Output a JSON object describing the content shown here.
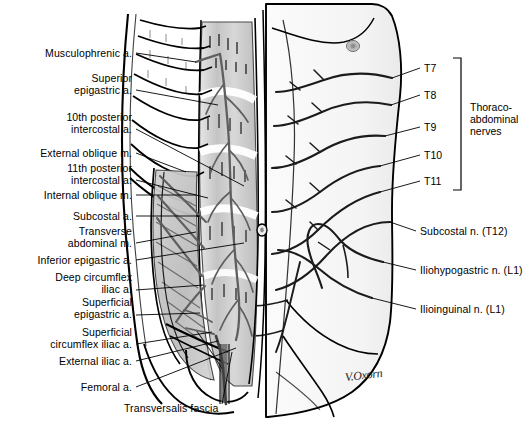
{
  "figure": {
    "signature": "V.Oxorn",
    "background_color": "#ffffff",
    "ink_color": "#000000",
    "muscle_shade_color": "#c9c9c9",
    "vessel_color": "#5a5a5a"
  },
  "labels_left": [
    {
      "id": "musculophrenic-a",
      "text": "Musculophrenic a.",
      "x": 132,
      "y": 48,
      "leader": [
        136,
        53,
        196,
        62
      ]
    },
    {
      "id": "superior-epigastric-a",
      "text": "Superior\nepigastric a.",
      "x": 132,
      "y": 73,
      "leader": [
        136,
        90,
        218,
        105
      ]
    },
    {
      "id": "10th-posterior-intercostal-a",
      "text": "10th posterior\nintercostal a.",
      "x": 132,
      "y": 112,
      "leader": [
        136,
        129,
        244,
        186
      ]
    },
    {
      "id": "external-oblique-m",
      "text": "External oblique m.",
      "x": 132,
      "y": 148,
      "leader": [
        136,
        153,
        186,
        172
      ]
    },
    {
      "id": "11th-posterior-intercostal-a",
      "text": "11th posterior\nintercostal a.",
      "x": 132,
      "y": 163,
      "leader": [
        136,
        180,
        208,
        198
      ]
    },
    {
      "id": "internal-oblique-m",
      "text": "Internal oblique m.",
      "x": 132,
      "y": 190,
      "leader": [
        136,
        195,
        196,
        195
      ]
    },
    {
      "id": "subcostal-a",
      "text": "Subcostal a.",
      "x": 132,
      "y": 211,
      "leader": [
        136,
        216,
        200,
        216
      ]
    },
    {
      "id": "transverse-abdominal-m",
      "text": "Transverse\nabdominal m.",
      "x": 132,
      "y": 226,
      "leader": [
        136,
        243,
        196,
        232
      ]
    },
    {
      "id": "inferior-epigastric-a",
      "text": "Inferior epigastric a.",
      "x": 132,
      "y": 255,
      "leader": [
        136,
        260,
        244,
        243
      ]
    },
    {
      "id": "deep-circumflex-iliac-a",
      "text": "Deep circumflex\niliac a.",
      "x": 132,
      "y": 272,
      "leader": [
        136,
        290,
        204,
        285
      ]
    },
    {
      "id": "superficial-epigastric-a",
      "text": "Superficial\nepigastric a.",
      "x": 132,
      "y": 297,
      "leader": [
        136,
        315,
        200,
        313
      ]
    },
    {
      "id": "superficial-circumflex-iliac-a",
      "text": "Superficial\ncircumflex iliac a.",
      "x": 132,
      "y": 327,
      "leader": [
        136,
        344,
        212,
        332
      ]
    },
    {
      "id": "external-iliac-a",
      "text": "External iliac a.",
      "x": 132,
      "y": 356,
      "leader": [
        136,
        361,
        218,
        341
      ]
    },
    {
      "id": "femoral-a",
      "text": "Femoral a.",
      "x": 132,
      "y": 382,
      "leader": [
        136,
        387,
        236,
        348
      ]
    }
  ],
  "labels_bottom": [
    {
      "id": "transversalis-fascia",
      "text": "Transversalis fascia",
      "x": 124,
      "y": 403,
      "leader": [
        222,
        404,
        232,
        352
      ]
    }
  ],
  "labels_right": [
    {
      "id": "subcostal-n-t12",
      "text": "Subcostal n. (T12)",
      "x": 420,
      "y": 226,
      "leader": [
        416,
        231,
        390,
        222
      ]
    },
    {
      "id": "iliohypogastric-n-l1",
      "text": "Iliohypogastric n. (L1)",
      "x": 420,
      "y": 265,
      "leader": [
        416,
        270,
        383,
        262
      ]
    },
    {
      "id": "ilioinguinal-n-l1",
      "text": "Ilioinguinal n. (L1)",
      "x": 420,
      "y": 304,
      "leader": [
        416,
        309,
        372,
        298
      ]
    }
  ],
  "nerve_levels": [
    {
      "id": "t7",
      "text": "T7",
      "x": 424,
      "y": 63,
      "leader": [
        420,
        68,
        392,
        78
      ]
    },
    {
      "id": "t8",
      "text": "T8",
      "x": 424,
      "y": 90,
      "leader": [
        420,
        95,
        391,
        105
      ]
    },
    {
      "id": "t9",
      "text": "T9",
      "x": 424,
      "y": 122,
      "leader": [
        420,
        127,
        385,
        136
      ]
    },
    {
      "id": "t10",
      "text": "T10",
      "x": 424,
      "y": 150,
      "leader": [
        420,
        155,
        380,
        166
      ]
    },
    {
      "id": "t11",
      "text": "T11",
      "x": 424,
      "y": 176,
      "leader": [
        420,
        181,
        380,
        192
      ]
    }
  ],
  "bracket": {
    "id": "thoraco-abdominal-bracket",
    "x": 461,
    "y_top": 58,
    "y_bottom": 190,
    "tick": 8,
    "label": "Thoraco-\nabdominal\nnerves",
    "label_x": 470,
    "label_y": 101
  }
}
